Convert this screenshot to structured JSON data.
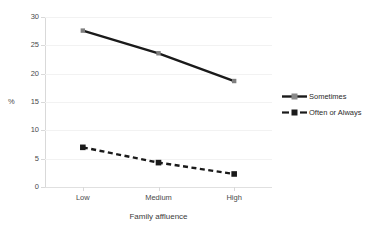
{
  "chart_data": {
    "type": "line",
    "title": "",
    "xlabel": "Family affluence",
    "ylabel": "%",
    "categories": [
      "Low",
      "Medium",
      "High"
    ],
    "ylim": [
      0,
      30
    ],
    "ytick_labels": [
      "0",
      "5",
      "10",
      "15",
      "20",
      "25",
      "30"
    ],
    "ytick_values": [
      0,
      5,
      10,
      15,
      20,
      25,
      30
    ],
    "grid": true,
    "legend_position": "right",
    "series": [
      {
        "name": "Sometimes",
        "values": [
          27.6,
          23.6,
          18.7
        ],
        "line_style": "solid",
        "marker": "diamond",
        "color": "#1a1a1a",
        "marker_color": "#7f7f7f"
      },
      {
        "name": "Often or Always",
        "values": [
          7.0,
          4.3,
          2.3
        ],
        "line_style": "dashed",
        "marker": "square",
        "color": "#1a1a1a",
        "marker_color": "#1a1a1a"
      }
    ]
  },
  "axis": {
    "y_title": "%",
    "x_title": "Family affluence"
  },
  "legend": {
    "items": [
      {
        "label": "Sometimes"
      },
      {
        "label": "Often or Always"
      }
    ]
  }
}
